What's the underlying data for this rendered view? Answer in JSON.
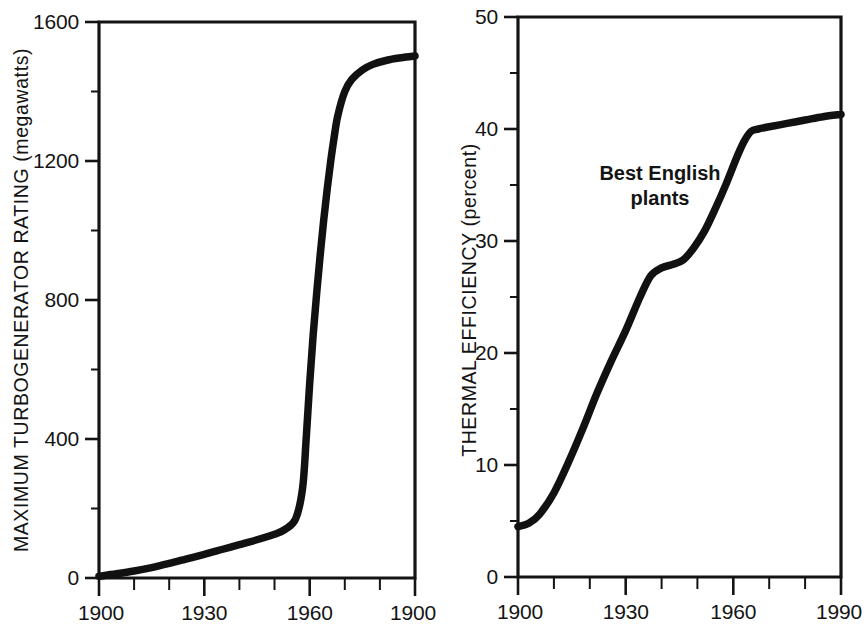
{
  "figure": {
    "background_color": "#ffffff",
    "ink_color": "#141414",
    "panels": [
      "left",
      "right"
    ]
  },
  "chart_data": [
    {
      "id": "left",
      "type": "line",
      "title": "",
      "xlabel": "",
      "ylabel": "MAXIMUM TURBOGENERATOR RATING (megawatts)",
      "ylabel_main": "MAXIMUM TURBOGENERATOR RATING",
      "ylabel_unit": "(megawatts)",
      "xlim": [
        1900,
        1990
      ],
      "ylim": [
        0,
        1600
      ],
      "grid": false,
      "legend": false,
      "x_major_ticks": [
        1900,
        1930,
        1960,
        1990
      ],
      "x_major_labels": [
        "1900",
        "1930",
        "1960",
        "1900"
      ],
      "x_minor_ticks": [
        1910,
        1920,
        1940,
        1950,
        1970,
        1980
      ],
      "y_major_ticks": [
        0,
        400,
        800,
        1200,
        1600
      ],
      "y_major_labels": [
        "0",
        "400",
        "800",
        "1200",
        "1600"
      ],
      "y_minor_ticks": [
        200,
        600,
        1000,
        1400
      ],
      "series": [
        {
          "name": "Maximum turbogenerator rating",
          "x": [
            1900,
            1905,
            1910,
            1915,
            1920,
            1925,
            1930,
            1935,
            1940,
            1945,
            1950,
            1953,
            1956,
            1958,
            1959,
            1960,
            1961,
            1962,
            1963,
            1964,
            1965,
            1966,
            1967,
            1968,
            1970,
            1972,
            1975,
            1978,
            1982,
            1986,
            1990
          ],
          "y": [
            5,
            12,
            20,
            30,
            42,
            55,
            68,
            82,
            96,
            110,
            126,
            140,
            170,
            260,
            400,
            560,
            700,
            820,
            930,
            1030,
            1120,
            1200,
            1270,
            1330,
            1400,
            1435,
            1462,
            1478,
            1490,
            1497,
            1502
          ]
        }
      ]
    },
    {
      "id": "right",
      "type": "line",
      "title": "",
      "xlabel": "",
      "ylabel": "THERMAL EFFICIENCY (percent)",
      "ylabel_main": "THERMAL EFFICIENCY",
      "ylabel_unit": "(percent)",
      "xlim": [
        1900,
        1990
      ],
      "ylim": [
        0,
        50
      ],
      "grid": false,
      "legend": false,
      "annotation": "Best English plants",
      "annotation_lines": [
        "Best English",
        "plants"
      ],
      "x_major_ticks": [
        1900,
        1930,
        1960,
        1990
      ],
      "x_major_labels": [
        "1900",
        "1930",
        "1960",
        "1990"
      ],
      "x_minor_ticks": [
        1910,
        1920,
        1940,
        1950,
        1970,
        1980
      ],
      "y_major_ticks": [
        0,
        10,
        20,
        30,
        40,
        50
      ],
      "y_major_labels": [
        "0",
        "10",
        "20",
        "30",
        "40",
        "50"
      ],
      "y_minor_ticks": [
        5,
        15,
        25,
        35,
        45
      ],
      "series": [
        {
          "name": "Best English plants thermal efficiency",
          "x": [
            1900,
            1903,
            1906,
            1910,
            1914,
            1918,
            1922,
            1926,
            1930,
            1934,
            1937,
            1940,
            1943,
            1946,
            1949,
            1952,
            1955,
            1958,
            1961,
            1963,
            1965,
            1967,
            1970,
            1975,
            1980,
            1985,
            1990
          ],
          "y": [
            4.5,
            4.8,
            5.6,
            7.5,
            10.2,
            13.2,
            16.4,
            19.3,
            22.0,
            25.0,
            26.9,
            27.6,
            27.9,
            28.3,
            29.4,
            30.9,
            32.9,
            35.1,
            37.5,
            38.9,
            39.8,
            40.0,
            40.2,
            40.5,
            40.8,
            41.1,
            41.3
          ]
        }
      ]
    }
  ]
}
